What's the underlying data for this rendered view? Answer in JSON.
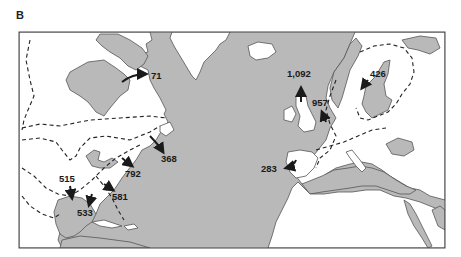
{
  "figure": {
    "panel_label": "B",
    "type": "map",
    "region": "North Atlantic (North America, Europe, North Africa)"
  },
  "colors": {
    "ocean": "#b9b9b9",
    "land": "#ffffff",
    "coastline": "#555555",
    "frame": "#444444",
    "dashed_boundary": "#222222",
    "arrow": "#1a1a1a",
    "label_text": "#1a1a1a"
  },
  "legend_elements": {
    "dashed_line": "distribution boundary",
    "arrow": "location of count"
  },
  "markers": [
    {
      "id": "m71",
      "label": "71",
      "location": "Hudson Bay / Labrador"
    },
    {
      "id": "m368",
      "label": "368",
      "location": "Nova Scotia"
    },
    {
      "id": "m792",
      "label": "792",
      "location": "Mid-Atlantic US coast"
    },
    {
      "id": "m581",
      "label": "581",
      "location": "Southeast US coast"
    },
    {
      "id": "m515",
      "label": "515",
      "location": "Texas / Gulf coast"
    },
    {
      "id": "m533",
      "label": "533",
      "location": "Florida Gulf coast"
    },
    {
      "id": "m1092",
      "label": "1,092",
      "location": "Scotland"
    },
    {
      "id": "m957",
      "label": "957",
      "location": "Netherlands / North Sea"
    },
    {
      "id": "m426",
      "label": "426",
      "location": "Baltic Sea / Sweden"
    },
    {
      "id": "m283",
      "label": "283",
      "location": "Portugal"
    }
  ]
}
